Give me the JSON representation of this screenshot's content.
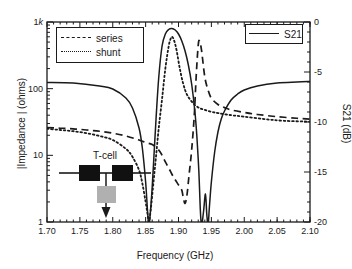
{
  "chart_data": {
    "type": "line",
    "title": "",
    "xlabel": "Frequency (GHz)",
    "ylabel_left": "|Impedance | (ohms)",
    "ylabel_right": "S21 (dB)",
    "xlim": [
      1.7,
      2.1
    ],
    "xticks": [
      "1.70",
      "1.75",
      "1.80",
      "1.85",
      "1.90",
      "1.95",
      "2.00",
      "2.05",
      "2.10"
    ],
    "xtick_values": [
      1.7,
      1.75,
      1.8,
      1.85,
      1.9,
      1.95,
      2.0,
      2.05,
      2.1
    ],
    "yleft_scale": "log",
    "yleft_lim": [
      1,
      1000
    ],
    "yleft_ticks": [
      "1",
      "10",
      "100",
      "1k"
    ],
    "yleft_tick_values": [
      1,
      10,
      100,
      1000
    ],
    "yright_scale": "linear",
    "yright_lim": [
      -20,
      0
    ],
    "yright_ticks": [
      "0",
      "-5",
      "-10",
      "-15",
      "-20"
    ],
    "yright_tick_values": [
      0,
      -5,
      -10,
      -15,
      -20
    ],
    "grid": false,
    "legend_position": "upper-left and upper-right",
    "series": [
      {
        "name": "series",
        "style": "dashed",
        "axis": "left",
        "unit": "ohms",
        "x": [
          1.7,
          1.72,
          1.74,
          1.76,
          1.78,
          1.8,
          1.82,
          1.84,
          1.85,
          1.86,
          1.87,
          1.875,
          1.88,
          1.885,
          1.89,
          1.895,
          1.9,
          1.905,
          1.907,
          1.91,
          1.913,
          1.916,
          1.92,
          1.924,
          1.927,
          1.93,
          1.932,
          1.935,
          1.94,
          1.945,
          1.95,
          1.96,
          1.97,
          1.98,
          2.0,
          2.02,
          2.05,
          2.08,
          2.1
        ],
        "y": [
          26,
          25.5,
          25,
          24,
          23,
          21.5,
          19.5,
          17,
          15.5,
          14.5,
          12,
          10,
          8,
          6.5,
          5.2,
          4.3,
          3.6,
          3.0,
          2.4,
          1.9,
          2.6,
          5.0,
          12,
          40,
          160,
          450,
          520,
          380,
          150,
          95,
          72,
          58,
          52,
          48,
          44,
          41,
          38,
          36,
          35
        ]
      },
      {
        "name": "shunt",
        "style": "dotted",
        "axis": "left",
        "unit": "ohms",
        "x": [
          1.7,
          1.72,
          1.74,
          1.76,
          1.78,
          1.8,
          1.82,
          1.83,
          1.84,
          1.845,
          1.85,
          1.853,
          1.855,
          1.858,
          1.862,
          1.866,
          1.87,
          1.875,
          1.88,
          1.885,
          1.888,
          1.89,
          1.893,
          1.897,
          1.902,
          1.907,
          1.912,
          1.918,
          1.925,
          1.932,
          1.94,
          1.95,
          1.96,
          1.98,
          2.0,
          2.03,
          2.06,
          2.1
        ],
        "y": [
          25,
          24,
          23,
          21.5,
          19.5,
          17,
          12.5,
          9.5,
          6.0,
          3.8,
          2.0,
          1.3,
          1.0,
          1.6,
          4.0,
          10,
          26,
          70,
          200,
          430,
          560,
          600,
          540,
          380,
          200,
          120,
          85,
          68,
          57,
          51,
          48,
          45,
          43,
          40,
          38,
          35,
          33,
          32
        ]
      },
      {
        "name": "S21",
        "style": "solid",
        "axis": "right",
        "unit": "dB",
        "x": [
          1.7,
          1.74,
          1.78,
          1.8,
          1.82,
          1.83,
          1.84,
          1.845,
          1.85,
          1.853,
          1.855,
          1.857,
          1.86,
          1.863,
          1.866,
          1.87,
          1.875,
          1.88,
          1.885,
          1.89,
          1.895,
          1.9,
          1.905,
          1.91,
          1.915,
          1.92,
          1.925,
          1.928,
          1.931,
          1.933,
          1.935,
          1.938,
          1.941,
          1.943,
          1.945,
          1.947,
          1.95,
          1.955,
          1.96,
          1.965,
          1.97,
          1.98,
          1.99,
          2.0,
          2.02,
          2.05,
          2.08,
          2.1
        ],
        "y": [
          -6.05,
          -6.1,
          -6.4,
          -6.7,
          -7.6,
          -8.6,
          -10.6,
          -12.6,
          -16.0,
          -19.0,
          -20.3,
          -19.2,
          -16.5,
          -13.0,
          -9.5,
          -5.5,
          -2.4,
          -1.2,
          -0.75,
          -0.65,
          -0.8,
          -1.2,
          -1.9,
          -2.9,
          -4.3,
          -6.2,
          -9.0,
          -11.5,
          -15.0,
          -18.5,
          -20.3,
          -19.0,
          -17.2,
          -19.2,
          -20.3,
          -18.5,
          -16.0,
          -13.0,
          -11.0,
          -9.7,
          -8.9,
          -7.8,
          -7.2,
          -6.8,
          -6.4,
          -6.1,
          -6.0,
          -5.95
        ]
      }
    ],
    "annotations": [
      {
        "name": "T-cell inset",
        "label": "T-cell",
        "description": "Schematic: two series resonators in-line with one shunt resonator to ground"
      }
    ]
  },
  "legend_impedance": {
    "rows": [
      {
        "label": "series",
        "sample": "dashed-line-sample"
      },
      {
        "label": "shunt",
        "sample": "dotted-line-sample"
      }
    ]
  },
  "legend_s21": {
    "rows": [
      {
        "label": "S21",
        "sample": "solid-line-sample"
      }
    ]
  },
  "inset": {
    "label": "T-cell"
  },
  "colors": {
    "line": "#1a1a1a",
    "background": "#ffffff",
    "series_resonator_fill": "#111111",
    "shunt_resonator_fill": "#b0b0b0"
  }
}
